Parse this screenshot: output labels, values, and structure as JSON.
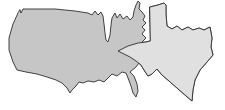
{
  "figure": {
    "kind": "map-size-comparison-illustration",
    "colors": {
      "background": "#ffffff",
      "us_fill": "#c6c6c6",
      "texas_fill": "#e0e0e0",
      "outline": "#2f2f2f"
    },
    "shapes": [
      {
        "name": "contiguous-united-states-silhouette"
      },
      {
        "name": "enlarged-texas-silhouette"
      }
    ]
  }
}
